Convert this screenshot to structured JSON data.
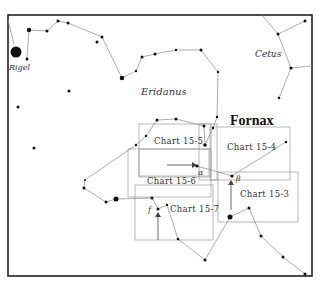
{
  "figure": {
    "title": "Fornax",
    "constellation_labels": {
      "eridanus": "Eridanus",
      "cetus": "Cetus",
      "rigel": "Rigel"
    },
    "star_labels": {
      "alpha": "α",
      "beta": "β",
      "f": "f"
    },
    "chart_boxes": [
      {
        "id": "15-3",
        "label": "Chart 15-3"
      },
      {
        "id": "15-4",
        "label": "Chart 15-4"
      },
      {
        "id": "15-5",
        "label": "Chart 15-5"
      },
      {
        "id": "15-6",
        "label": "Chart 15-6"
      },
      {
        "id": "15-7",
        "label": "Chart 15-7"
      }
    ]
  }
}
